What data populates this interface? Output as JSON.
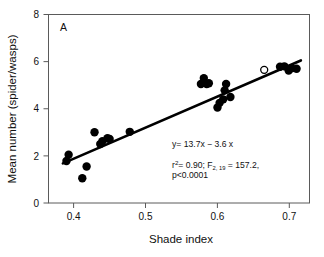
{
  "chart_data": {
    "type": "scatter",
    "title": "",
    "panel_label": "A",
    "xlabel": "Shade index",
    "ylabel": "Mean number (spider/wasps)",
    "xlim": [
      0.365,
      0.728
    ],
    "ylim": [
      0,
      8
    ],
    "xticks": [
      0.4,
      0.5,
      0.6,
      0.7
    ],
    "xtick_labels": [
      "0.4",
      "0.5",
      "0.6",
      "0.7"
    ],
    "yticks": [
      0,
      2,
      4,
      6,
      8
    ],
    "ytick_labels": [
      "0",
      "2",
      "4",
      "6",
      "8"
    ],
    "grid": false,
    "legend": false,
    "frame": "box",
    "series": [
      {
        "name": "filled",
        "marker": "filled-circle",
        "color": "#000000",
        "points": [
          [
            0.39,
            1.78
          ],
          [
            0.393,
            2.05
          ],
          [
            0.412,
            1.05
          ],
          [
            0.418,
            1.55
          ],
          [
            0.429,
            3.0
          ],
          [
            0.437,
            2.5
          ],
          [
            0.44,
            2.62
          ],
          [
            0.447,
            2.75
          ],
          [
            0.45,
            2.72
          ],
          [
            0.478,
            3.02
          ],
          [
            0.577,
            5.05
          ],
          [
            0.581,
            5.3
          ],
          [
            0.585,
            5.05
          ],
          [
            0.588,
            5.08
          ],
          [
            0.6,
            4.05
          ],
          [
            0.603,
            4.25
          ],
          [
            0.608,
            4.4
          ],
          [
            0.61,
            4.78
          ],
          [
            0.612,
            5.05
          ],
          [
            0.618,
            4.5
          ],
          [
            0.687,
            5.78
          ],
          [
            0.693,
            5.8
          ],
          [
            0.699,
            5.62
          ],
          [
            0.703,
            5.72
          ],
          [
            0.71,
            5.7
          ]
        ]
      },
      {
        "name": "open",
        "marker": "open-circle",
        "color": "#ffffff",
        "points": [
          [
            0.665,
            5.65
          ]
        ]
      }
    ],
    "fit_line": {
      "slope": 13.7,
      "intercept": -3.6,
      "x_start": 0.385,
      "x_end": 0.716,
      "y_start": 1.68,
      "y_end": 6.05
    },
    "annotations": {
      "equation": "y= 13.7x − 3.6 x",
      "stats_prefix": "r",
      "stats_sup": "2",
      "stats_mid": "= 0.90; F",
      "stats_sub": "2, 19",
      "stats_tail": " = 157.2,",
      "pvalue": "p<0.0001"
    }
  }
}
